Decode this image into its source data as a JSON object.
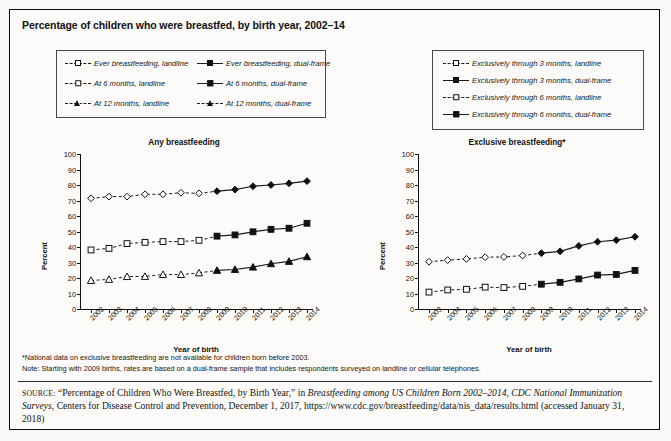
{
  "figure": {
    "title": "Percentage of children who were breastfed, by birth year, 2002–14",
    "notes": [
      "*National data on exclusive breastfeeding are not available for children born before 2003.",
      "Note: Starting with 2009 births, rates are based on a dual-frame sample that includes respondents surveyed on landline or cellular telephones."
    ],
    "source": {
      "label": "SOURCE:",
      "text_1": " “Percentage of Children Who Were Breastfed, by Birth Year,” in ",
      "italic_1": "Breastfeeding among US Children Born  2002–2014, CDC National Immunization Surveys",
      "text_2": ", Centers for Disease Control and Prevention, December 1, 2017, https://www.cdc.gov/breastfeeding/data/nis_data/results.html (accessed January 31, 2018)"
    }
  },
  "legend_left": {
    "items": [
      {
        "label": "Ever breastfeeding, landline",
        "marker": "diamond-open",
        "line": "dashed"
      },
      {
        "label": "Ever breastfeeding, dual-frame",
        "marker": "diamond-filled",
        "line": "solid"
      },
      {
        "label": "At 6 months, landline",
        "marker": "square-open",
        "line": "dashed"
      },
      {
        "label": "At 6 months, dual-frame",
        "marker": "square-filled",
        "line": "solid"
      },
      {
        "label": "At 12 months, landline",
        "marker": "triangle-open",
        "line": "dashed"
      },
      {
        "label": "At 12 months, dual-frame",
        "marker": "triangle-filled",
        "line": "dashed"
      }
    ]
  },
  "legend_right": {
    "items": [
      {
        "label": "Exclusively through 3 months, landline",
        "marker": "diamond-open",
        "line": "dashed"
      },
      {
        "label": "Exclusively through 3 months, dual-frame",
        "marker": "diamond-filled",
        "line": "solid"
      },
      {
        "label": "Exclusively through 6 months, landline",
        "marker": "square-open",
        "line": "dashed"
      },
      {
        "label": "Exclusively through 6 months, dual-frame",
        "marker": "square-filled",
        "line": "solid"
      }
    ]
  },
  "chart_data": [
    {
      "type": "line",
      "title": "Any breastfeeding",
      "xlabel": "Year of birth",
      "ylabel": "Percent",
      "ylim": [
        0,
        100
      ],
      "yticks": [
        0,
        10,
        20,
        30,
        40,
        50,
        60,
        70,
        80,
        90,
        100
      ],
      "grid": false,
      "legend_position": "above-left",
      "categories": [
        "2002",
        "2003",
        "2004",
        "2005",
        "2006",
        "2007",
        "2008",
        "2009",
        "2010",
        "2011",
        "2012",
        "2013",
        "2014"
      ],
      "series": [
        {
          "name": "Ever breastfeeding, landline",
          "marker": "diamond-open",
          "line": "dashed",
          "values": [
            71.4,
            72.5,
            72.5,
            74.0,
            74.0,
            75.0,
            74.6,
            null,
            null,
            null,
            null,
            null,
            null
          ]
        },
        {
          "name": "Ever breastfeeding, dual-frame",
          "marker": "diamond-filled",
          "line": "solid",
          "values": [
            null,
            null,
            null,
            null,
            null,
            null,
            null,
            76.0,
            77.0,
            79.2,
            80.0,
            81.1,
            82.5
          ]
        },
        {
          "name": "At 6 months, landline",
          "marker": "square-open",
          "line": "dashed",
          "values": [
            38.1,
            39.1,
            42.2,
            43.0,
            43.5,
            43.5,
            44.3,
            null,
            null,
            null,
            null,
            null,
            null
          ]
        },
        {
          "name": "At 6 months, dual-frame",
          "marker": "square-filled",
          "line": "solid",
          "values": [
            null,
            null,
            null,
            null,
            null,
            null,
            null,
            47.0,
            47.8,
            49.8,
            51.4,
            52.1,
            55.3
          ]
        },
        {
          "name": "At 12 months, landline",
          "marker": "triangle-open",
          "line": "dashed",
          "values": [
            18.4,
            19.1,
            20.9,
            21.0,
            22.2,
            22.2,
            23.3,
            null,
            null,
            null,
            null,
            null,
            null
          ]
        },
        {
          "name": "At 12 months, dual-frame",
          "marker": "triangle-filled",
          "line": "solid",
          "values": [
            null,
            null,
            null,
            null,
            null,
            null,
            null,
            24.9,
            25.5,
            27.0,
            29.2,
            30.7,
            33.7
          ]
        }
      ]
    },
    {
      "type": "line",
      "title": "Exclusive breastfeeding*",
      "xlabel": "Year of birth",
      "ylabel": "Percent",
      "ylim": [
        0,
        100
      ],
      "yticks": [
        0,
        10,
        20,
        30,
        40,
        50,
        60,
        70,
        80,
        90,
        100
      ],
      "grid": false,
      "legend_position": "above-right",
      "categories": [
        "2003",
        "2004",
        "2005",
        "2006",
        "2007",
        "2008",
        "2009",
        "2010",
        "2011",
        "2012",
        "2013",
        "2014"
      ],
      "series": [
        {
          "name": "Exclusively through 3 months, landline",
          "marker": "diamond-open",
          "line": "dashed",
          "values": [
            30.5,
            31.5,
            32.3,
            33.4,
            33.6,
            34.5,
            null,
            null,
            null,
            null,
            null,
            null
          ]
        },
        {
          "name": "Exclusively through 3 months, dual-frame",
          "marker": "diamond-filled",
          "line": "solid",
          "values": [
            null,
            null,
            null,
            null,
            null,
            null,
            36.0,
            37.2,
            40.7,
            43.4,
            44.4,
            46.6
          ]
        },
        {
          "name": "Exclusively through 6 months, landline",
          "marker": "square-open",
          "line": "dashed",
          "values": [
            10.9,
            12.3,
            12.7,
            14.1,
            13.8,
            14.6,
            null,
            null,
            null,
            null,
            null,
            null
          ]
        },
        {
          "name": "Exclusively through 6 months, dual-frame",
          "marker": "square-filled",
          "line": "solid",
          "values": [
            null,
            null,
            null,
            null,
            null,
            null,
            16.0,
            17.2,
            19.4,
            21.9,
            22.3,
            24.9
          ]
        }
      ]
    }
  ]
}
